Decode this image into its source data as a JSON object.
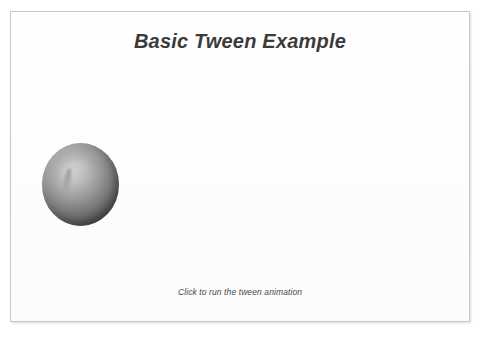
{
  "stage": {
    "title": "Basic Tween Example",
    "hint": "Click to run the tween animation",
    "frame_border_color": "#c9c9cc",
    "background_color": "#ffffff",
    "title_color": "#3b3b3b",
    "hint_color": "#4a4a4a"
  },
  "ball": {
    "name": "tween-ball",
    "shape": "sphere",
    "fill_light_color": "#cfcfcf",
    "fill_dark_color": "#474747",
    "center_x": 70,
    "center_y": 172,
    "width": 77,
    "height": 83
  }
}
